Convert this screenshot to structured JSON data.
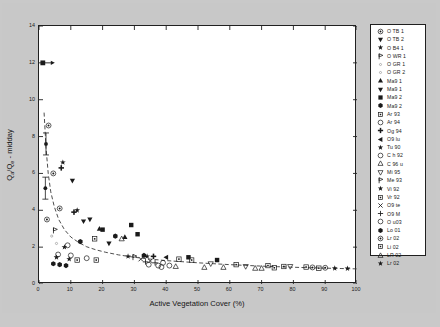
{
  "chart_data": {
    "type": "scatter",
    "title": "",
    "xlabel": "Active Vegetation Cover (%)",
    "ylabel": "Qa/Qe - midday",
    "ylabel_base": "Q",
    "ylabel_sub1": "a",
    "ylabel_mid": "/Q",
    "ylabel_sub2": "e",
    "ylabel_tail": " - midday",
    "xlim": [
      0,
      100
    ],
    "ylim": [
      0,
      14
    ],
    "xticks": [
      0,
      10,
      20,
      30,
      40,
      50,
      60,
      70,
      80,
      90,
      100
    ],
    "yticks": [
      0,
      2,
      4,
      6,
      8,
      10,
      12,
      14
    ],
    "grid": false,
    "legend_position": "right-outside",
    "annotations": [
      {
        "type": "arrow",
        "x": 1.2,
        "y": 12.0,
        "note": "off-scale arrow marker at left axis"
      },
      {
        "type": "errorbar",
        "x": 2.2,
        "y": 7.6,
        "note": "vertical error bar near axis"
      },
      {
        "type": "errorbar",
        "x": 2.0,
        "y": 5.2,
        "note": "vertical error bar near axis"
      }
    ],
    "fit_curve": {
      "name": "decay-fit",
      "style": "dashed",
      "points": [
        [
          1.6,
          9.3
        ],
        [
          2.2,
          7.4
        ],
        [
          2.9,
          6.0
        ],
        [
          3.7,
          5.0
        ],
        [
          4.8,
          4.2
        ],
        [
          6.2,
          3.5
        ],
        [
          8.0,
          2.95
        ],
        [
          10.0,
          2.55
        ],
        [
          12.5,
          2.25
        ],
        [
          15.0,
          2.02
        ],
        [
          18.0,
          1.85
        ],
        [
          21.0,
          1.72
        ],
        [
          25.0,
          1.58
        ],
        [
          30.0,
          1.45
        ],
        [
          35.0,
          1.35
        ],
        [
          40.0,
          1.27
        ],
        [
          45.0,
          1.21
        ],
        [
          50.0,
          1.15
        ],
        [
          55.0,
          1.1
        ],
        [
          60.0,
          1.05
        ],
        [
          65.0,
          1.01
        ],
        [
          70.0,
          0.97
        ],
        [
          75.0,
          0.94
        ],
        [
          80.0,
          0.91
        ],
        [
          85.0,
          0.88
        ],
        [
          90.0,
          0.86
        ],
        [
          95.0,
          0.84
        ],
        [
          100.0,
          0.82
        ]
      ]
    },
    "series": [
      {
        "name": "OTB1",
        "label": "O TB 1",
        "marker": "circle-dot",
        "filled": true,
        "points": [
          [
            3.0,
            8.6
          ],
          [
            4.5,
            6.0
          ],
          [
            6.5,
            4.1
          ],
          [
            2.5,
            3.5
          ]
        ]
      },
      {
        "name": "OTB2",
        "label": "O TB 2",
        "marker": "triangle-down",
        "filled": true,
        "points": [
          [
            10.5,
            5.6
          ],
          [
            14.0,
            3.4
          ]
        ]
      },
      {
        "name": "OB41",
        "label": "O B4 1",
        "marker": "star-small",
        "filled": true,
        "points": [
          [
            7.5,
            6.6
          ],
          [
            12.0,
            4.0
          ]
        ]
      },
      {
        "name": "OWR1",
        "label": "O WR 1",
        "marker": "flag",
        "filled": false,
        "points": [
          [
            5.0,
            2.9
          ]
        ]
      },
      {
        "name": "OGR1",
        "label": "O GR 1",
        "marker": "dot-tiny",
        "filled": false,
        "points": [
          [
            4.0,
            2.6
          ]
        ]
      },
      {
        "name": "OGR2",
        "label": "O GR 2",
        "marker": "dot-tiny",
        "filled": false,
        "points": [
          [
            5.5,
            2.2
          ]
        ]
      },
      {
        "name": "Ma91a",
        "label": "Ma9 1",
        "marker": "triangle-up",
        "filled": true,
        "points": [
          [
            19.0,
            3.0
          ],
          [
            27.0,
            2.55
          ]
        ]
      },
      {
        "name": "Ma91b",
        "label": "Ma9 1",
        "marker": "triangle-down",
        "filled": true,
        "points": [
          [
            16.0,
            3.5
          ],
          [
            22.0,
            2.2
          ]
        ]
      },
      {
        "name": "Ma92a",
        "label": "Ma9 2",
        "marker": "square",
        "filled": true,
        "points": [
          [
            20.0,
            2.95
          ],
          [
            29.0,
            3.2
          ],
          [
            31.0,
            2.7
          ],
          [
            47.0,
            1.45
          ],
          [
            56.0,
            1.3
          ]
        ]
      },
      {
        "name": "Ma92b",
        "label": "Ma9 2",
        "marker": "hexagon",
        "filled": true,
        "points": [
          [
            13.0,
            2.3
          ],
          [
            24.0,
            2.6
          ],
          [
            33.0,
            1.55
          ]
        ]
      },
      {
        "name": "Ar93",
        "label": "Ar 93",
        "marker": "square-open",
        "filled": false,
        "points": [
          [
            17.5,
            2.45
          ],
          [
            44.0,
            1.35
          ],
          [
            48.0,
            1.3
          ],
          [
            62.0,
            1.05
          ],
          [
            72.0,
            1.0
          ]
        ]
      },
      {
        "name": "Ar94",
        "label": "Ar 94",
        "marker": "circle-open",
        "filled": false,
        "points": [
          [
            9.0,
            2.1
          ],
          [
            39.0,
            1.15
          ],
          [
            41.0,
            1.0
          ]
        ]
      },
      {
        "name": "Og94",
        "label": "Og 94",
        "marker": "plus-bold",
        "filled": true,
        "points": [
          [
            7.0,
            6.3
          ],
          [
            11.0,
            3.9
          ],
          [
            36.0,
            1.5
          ]
        ]
      },
      {
        "name": "O9lu",
        "label": "O9 lu",
        "marker": "triangle-left",
        "filled": true,
        "points": [
          [
            40.0,
            1.45
          ]
        ]
      },
      {
        "name": "Tu90",
        "label": "Tu 90",
        "marker": "star-small",
        "filled": true,
        "points": [
          [
            8.0,
            2.0
          ],
          [
            34.0,
            1.5
          ]
        ]
      },
      {
        "name": "Ch92",
        "label": "C h 92",
        "marker": "circle-open",
        "filled": false,
        "points": [
          [
            6.0,
            1.6
          ],
          [
            10.0,
            1.55
          ],
          [
            15.0,
            1.4
          ]
        ]
      },
      {
        "name": "C96u",
        "label": "C 96 u",
        "marker": "triangle-up-open",
        "filled": false,
        "points": [
          [
            26.0,
            2.45
          ],
          [
            43.0,
            0.95
          ],
          [
            58.0,
            0.9
          ],
          [
            68.0,
            0.85
          ]
        ]
      },
      {
        "name": "Mi95",
        "label": "Mi 95",
        "marker": "triangle-down-open",
        "filled": false,
        "points": [
          [
            54.0,
            1.1
          ],
          [
            65.0,
            0.95
          ],
          [
            79.0,
            0.95
          ]
        ]
      },
      {
        "name": "Me93",
        "label": "Me 93",
        "marker": "flag",
        "filled": false,
        "points": [
          [
            30.0,
            1.45
          ]
        ]
      },
      {
        "name": "Vi92",
        "label": "Vi 92",
        "marker": "star-small",
        "filled": true,
        "points": [
          [
            5.5,
            1.45
          ],
          [
            9.5,
            1.35
          ],
          [
            28.0,
            1.5
          ]
        ]
      },
      {
        "name": "Vr92",
        "label": "Vr 92",
        "marker": "square-open",
        "filled": false,
        "points": [
          [
            12.0,
            1.3
          ],
          [
            18.0,
            1.3
          ],
          [
            77.0,
            0.95
          ],
          [
            84.0,
            0.92
          ]
        ]
      },
      {
        "name": "O9te",
        "label": "O9 te",
        "marker": "x-mark",
        "filled": true,
        "points": [
          [
            32.0,
            1.35
          ],
          [
            35.0,
            1.25
          ]
        ]
      },
      {
        "name": "O9M",
        "label": "O9 M",
        "marker": "plus-thin",
        "filled": true,
        "points": [
          [
            33.5,
            1.2
          ],
          [
            36.5,
            1.15
          ]
        ]
      },
      {
        "name": "Ou03",
        "label": "O u03",
        "marker": "circle-open",
        "filled": false,
        "points": [
          [
            34.5,
            1.05
          ],
          [
            37.5,
            1.0
          ],
          [
            38.5,
            0.92
          ]
        ]
      },
      {
        "name": "Lo01",
        "label": "Lo 01",
        "marker": "hexagon",
        "filled": true,
        "points": [
          [
            4.5,
            1.1
          ],
          [
            6.5,
            1.05
          ],
          [
            8.5,
            1.0
          ]
        ]
      },
      {
        "name": "Lr02a",
        "label": "Lr 02",
        "marker": "circle-dot",
        "filled": true,
        "points": [
          [
            86.0,
            0.9
          ],
          [
            90.0,
            0.88
          ]
        ]
      },
      {
        "name": "Li02",
        "label": "Li 02",
        "marker": "square-open",
        "filled": false,
        "points": [
          [
            74.0,
            0.88
          ],
          [
            88.0,
            0.86
          ]
        ]
      },
      {
        "name": "LR02",
        "label": "LR 02",
        "marker": "triangle-up-open",
        "filled": false,
        "points": [
          [
            52.0,
            0.9
          ],
          [
            70.0,
            0.85
          ]
        ]
      },
      {
        "name": "Lr02b",
        "label": "Lr 02",
        "marker": "star-small",
        "filled": true,
        "points": [
          [
            93.0,
            0.85
          ],
          [
            97.0,
            0.84
          ]
        ]
      }
    ]
  },
  "axes": {
    "x_title": "Active Vegetation Cover (%)",
    "y_title_full": "Qa/Qe - midday",
    "x_ticks": [
      "0",
      "10",
      "20",
      "30",
      "40",
      "50",
      "60",
      "70",
      "80",
      "90",
      "100"
    ],
    "y_ticks": [
      "0",
      "2",
      "4",
      "6",
      "8",
      "10",
      "12",
      "14"
    ]
  },
  "legend": {
    "entries": [
      {
        "label": "O TB 1",
        "marker": "circle-dot"
      },
      {
        "label": "O TB 2",
        "marker": "triangle-down"
      },
      {
        "label": "O B4 1",
        "marker": "star-small"
      },
      {
        "label": "O WR 1",
        "marker": "flag"
      },
      {
        "label": "O GR 1",
        "marker": "dot-tiny"
      },
      {
        "label": "O GR 2",
        "marker": "dot-tiny"
      },
      {
        "label": "Ma9 1",
        "marker": "triangle-up"
      },
      {
        "label": "Ma9 1",
        "marker": "triangle-down"
      },
      {
        "label": "Ma9 2",
        "marker": "square"
      },
      {
        "label": "Ma9 2",
        "marker": "hexagon"
      },
      {
        "label": "Ar 93",
        "marker": "square-open"
      },
      {
        "label": "Ar 94",
        "marker": "circle-open"
      },
      {
        "label": "Og 94",
        "marker": "plus-bold"
      },
      {
        "label": "O9 lu",
        "marker": "triangle-left"
      },
      {
        "label": "Tu 90",
        "marker": "star-small"
      },
      {
        "label": "C h 92",
        "marker": "circle-open"
      },
      {
        "label": "C 96 u",
        "marker": "triangle-up-open"
      },
      {
        "label": "Mi 95",
        "marker": "triangle-down-open"
      },
      {
        "label": "Me 93",
        "marker": "flag"
      },
      {
        "label": "Vi 92",
        "marker": "star-small"
      },
      {
        "label": "Vr 92",
        "marker": "square-open"
      },
      {
        "label": "O9 te",
        "marker": "x-mark"
      },
      {
        "label": "O9 M",
        "marker": "plus-thin"
      },
      {
        "label": "O u03",
        "marker": "circle-open"
      },
      {
        "label": "Lo 01",
        "marker": "hexagon"
      },
      {
        "label": "Lr 02",
        "marker": "circle-dot"
      },
      {
        "label": "Li 02",
        "marker": "square-open"
      },
      {
        "label": "LR 02",
        "marker": "triangle-up-open"
      },
      {
        "label": "Lr 02",
        "marker": "star-small"
      }
    ]
  },
  "colors": {
    "background": "#c8c8c8",
    "plot_background": "#ffffff",
    "axis": "#202020",
    "marker": "#1a1a1a",
    "curve": "#3a3a3a"
  }
}
